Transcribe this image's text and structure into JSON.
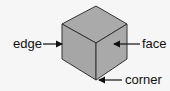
{
  "diagram": {
    "labels": {
      "edge": "edge",
      "face": "face",
      "corner": "corner"
    },
    "colors": {
      "background": "#f6f6f6",
      "face_fill": "#a9a9a9",
      "edge_stroke": "#333333",
      "text": "#111111"
    }
  }
}
